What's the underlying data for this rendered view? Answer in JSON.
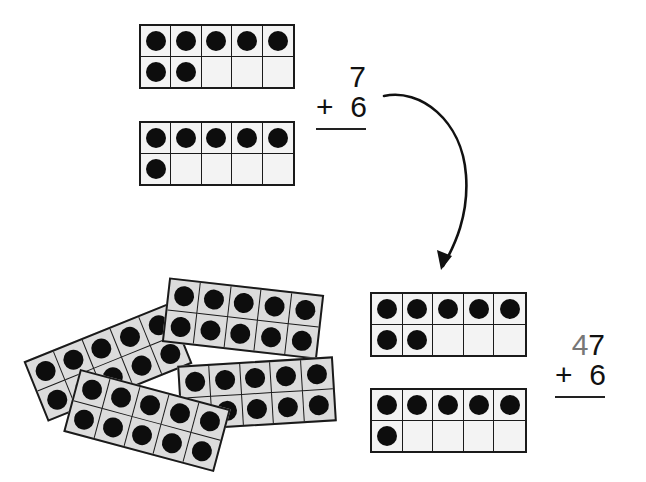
{
  "top_group": {
    "frames": [
      {
        "filled": 7,
        "total": 10
      },
      {
        "filled": 6,
        "total": 10
      }
    ],
    "equation": {
      "top": "7",
      "operator": "+",
      "bottom": "6"
    }
  },
  "arrow": {
    "description": "curved arrow from top equation to bottom frames"
  },
  "pile": {
    "description": "four full ten-frames (40) scattered",
    "frames": [
      {
        "filled": 10,
        "total": 10
      },
      {
        "filled": 10,
        "total": 10
      },
      {
        "filled": 10,
        "total": 10
      },
      {
        "filled": 10,
        "total": 10
      }
    ]
  },
  "bottom_group": {
    "frames": [
      {
        "filled": 7,
        "total": 10
      },
      {
        "filled": 6,
        "total": 10
      }
    ],
    "equation": {
      "tens_digit": "4",
      "ones_digit": "7",
      "operator": "+",
      "bottom": "6"
    }
  },
  "colors": {
    "ink": "#111111",
    "tens_digit": "#777777",
    "pile_fill": "#dcdcdc",
    "frame_fill": "#f3f3f3"
  }
}
